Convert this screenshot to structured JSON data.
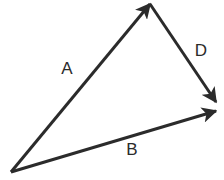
{
  "figure": {
    "background_color": "#ffffff",
    "stroke_color": "#2b2b2b",
    "label_color": "#2b2b2b",
    "stroke_width": 3,
    "width": 224,
    "height": 180
  },
  "points": {
    "origin": {
      "name": "origin-vertex",
      "x": 11,
      "y": 172
    },
    "apex": {
      "name": "apex-vertex",
      "x": 150,
      "y": 4
    },
    "right": {
      "name": "right-vertex",
      "x": 215,
      "y": 106
    }
  },
  "vectors": [
    {
      "id": "A",
      "label": "A",
      "from": "origin",
      "to": "apex",
      "x1": 11,
      "y1": 172,
      "x2": 150,
      "y2": 4,
      "arrowhead": "end",
      "label_x": 67,
      "label_y": 70
    },
    {
      "id": "D",
      "label": "D",
      "from": "apex",
      "to": "right",
      "x1": 150,
      "y1": 4,
      "x2": 216,
      "y2": 102,
      "arrowhead": "end",
      "label_x": 201,
      "label_y": 52
    },
    {
      "id": "B",
      "label": "B",
      "from": "origin",
      "to": "right",
      "x1": 11,
      "y1": 172,
      "x2": 216,
      "y2": 111,
      "arrowhead": "end",
      "label_x": 132,
      "label_y": 151
    }
  ],
  "labels": {
    "a": "A",
    "d": "D",
    "b": "B"
  }
}
